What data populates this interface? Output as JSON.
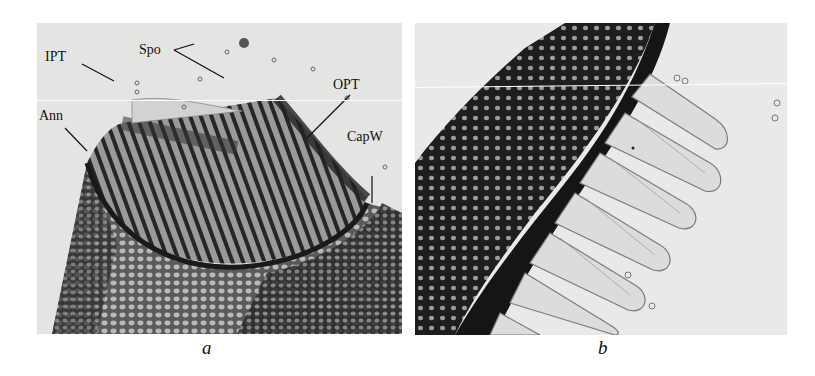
{
  "figure": {
    "panels": [
      {
        "id": "a",
        "caption": "a",
        "annotations": [
          {
            "key": "IPT",
            "text": "IPT"
          },
          {
            "key": "Spo",
            "text": "Spo"
          },
          {
            "key": "OPT",
            "text": "OPT"
          },
          {
            "key": "Ann",
            "text": "Ann"
          },
          {
            "key": "CapW",
            "text": "CapW"
          }
        ]
      },
      {
        "id": "b",
        "caption": "b",
        "annotations": []
      }
    ]
  }
}
